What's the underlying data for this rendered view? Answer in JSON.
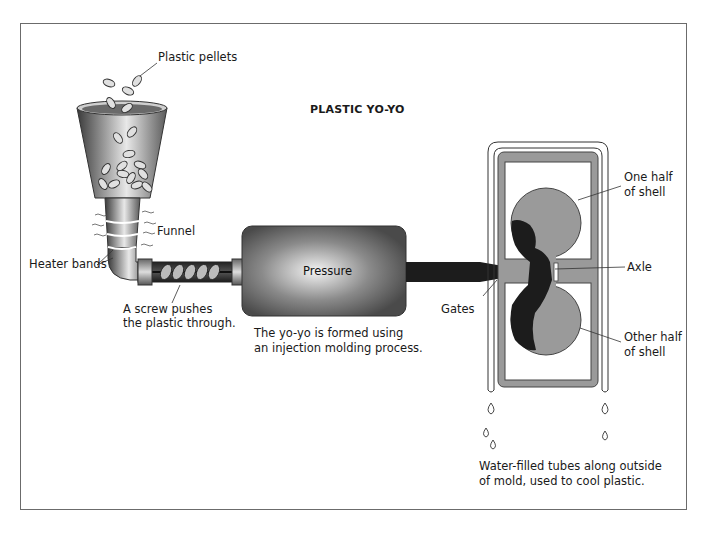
{
  "diagram": {
    "title": "PLASTIC YO-YO",
    "labels": {
      "pellets": "Plastic pellets",
      "funnel": "Funnel",
      "heater_bands": "Heater bands",
      "screw_line1": "A screw pushes",
      "screw_line2": "the plastic through.",
      "pressure": "Pressure",
      "process_line1": "The yo-yo is formed using",
      "process_line2": "an injection molding process.",
      "gates": "Gates",
      "one_half_line1": "One half",
      "one_half_line2": "of shell",
      "axle": "Axle",
      "other_half_line1": "Other half",
      "other_half_line2": "of shell",
      "water_line1": "Water-filled tubes along outside",
      "water_line2": "of mold, used to cool plastic."
    },
    "colors": {
      "frame": "#6b6b6b",
      "mold_gray": "#9a9a9a",
      "plastic_black": "#1c1c1c",
      "pressure_box": "#4a4a4a"
    }
  }
}
